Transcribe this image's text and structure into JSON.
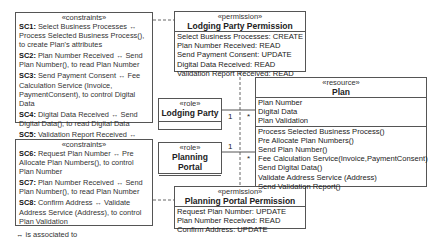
{
  "constraints_top": {
    "stereotype": "«constraints»",
    "items": [
      {
        "id": "SC1:",
        "text": " Select Business Processes ↔ Process Selected Business Process(), to create Plan's attributes"
      },
      {
        "id": "SC2:",
        "text": " Plan Number Received ↔ Send Plan Number(), to read Plan Number"
      },
      {
        "id": "SC3:",
        "text": " Send Payment Consent ↔ Fee Calculation Service (Invoice, PaymentConsent), to control Digital Data"
      },
      {
        "id": "SC4:",
        "text": " Digital Data Received ↔ Send Digital Data(), to read Digital Data"
      },
      {
        "id": "SC5:",
        "text": " Validation Report Received ↔ Send Validation Report(), to read Plan Validation"
      }
    ]
  },
  "constraints_bottom": {
    "stereotype": "«constraints»",
    "items": [
      {
        "id": "SC6:",
        "text": " Request Plan Number ↔ Pre Allocate Plan Numbers(), to control Plan Number"
      },
      {
        "id": "SC7:",
        "text": " Plan Number Received ↔ Send Plan Number(), to read Plan Number"
      },
      {
        "id": "SC8:",
        "text": " Confirm Address ↔ Validate Address Service (Address), to control Plan Validation"
      }
    ]
  },
  "legend": "↔ is associated to",
  "lodging_permission": {
    "stereotype": "«permission»",
    "title": "Lodging Party Permission",
    "lines": [
      "Select Business Processes: CREATE",
      "Plan Number Received: READ",
      "Send Payment Consent: UPDATE",
      "Digital Data Received: READ",
      "Validation Report Received: READ"
    ]
  },
  "planning_permission": {
    "stereotype": "«permission»",
    "title": "Planning Portal Permission",
    "lines": [
      "Request Plan Number: UPDATE",
      "Plan Number Received: READ",
      "Confirm Address: UPDATE"
    ]
  },
  "role_lodging": {
    "stereotype": "«role»",
    "title": "Lodging Party"
  },
  "role_planning": {
    "stereotype": "«role»",
    "title": "Planning Portal"
  },
  "resource_plan": {
    "stereotype": "«resource»",
    "title": "Plan",
    "attributes": [
      "Plan Number",
      "Digital Data",
      "Plan Validation"
    ],
    "operations": [
      "Process Selected Business Process()",
      "Pre Allocate Plan Numbers()",
      "Send Plan Number()",
      "Fee Calculation Service(Invoice,PaymentConsent)",
      "Send Digital Data()",
      "Validate Address Service (Address)",
      "Send Validation Report()"
    ]
  },
  "multiplicities": {
    "lodging_role": "1",
    "lodging_plan": "*",
    "planning_role": "1",
    "planning_plan": "*"
  }
}
